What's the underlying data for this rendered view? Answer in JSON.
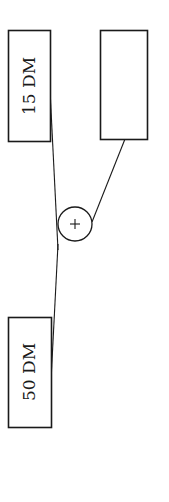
{
  "diagram": {
    "nodes": [
      {
        "id": "box-top-left",
        "label": "15 DM"
      },
      {
        "id": "box-top-right",
        "label": ""
      },
      {
        "id": "box-bottom-left",
        "label": "50 DM"
      }
    ],
    "operator": {
      "symbol": "+"
    },
    "edges": [
      {
        "from": "box-top-left",
        "to": "plus-node"
      },
      {
        "from": "box-top-right",
        "to": "plus-node"
      },
      {
        "from": "plus-node",
        "to": "box-bottom-left"
      }
    ],
    "colors": {
      "stroke": "#1a1a1a",
      "background": "#ffffff"
    }
  }
}
